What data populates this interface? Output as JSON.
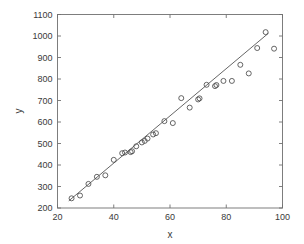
{
  "figure": {
    "background_color": "#ffffff",
    "axis_color": "#707070",
    "marker_color": "#4a4a4a",
    "line_color": "#555555"
  },
  "axes": {
    "x_title": "x",
    "y_title": "y",
    "x_ticks": [
      "20",
      "40",
      "60",
      "80",
      "100"
    ],
    "y_ticks": [
      "200",
      "300",
      "400",
      "500",
      "600",
      "700",
      "800",
      "900",
      "1000",
      "1100"
    ]
  },
  "chart_data": {
    "type": "scatter",
    "title": "",
    "xlabel": "x",
    "ylabel": "y",
    "xlim": [
      20,
      100
    ],
    "ylim": [
      200,
      1100
    ],
    "xticks": [
      20,
      40,
      60,
      80,
      100
    ],
    "yticks": [
      200,
      300,
      400,
      500,
      600,
      700,
      800,
      900,
      1000,
      1100
    ],
    "grid": false,
    "legend": null,
    "marker": "open-circle",
    "series": [
      {
        "name": "observations",
        "type": "scatter",
        "points": [
          [
            25,
            245
          ],
          [
            28,
            258
          ],
          [
            31,
            312
          ],
          [
            34,
            345
          ],
          [
            37,
            352
          ],
          [
            40,
            424
          ],
          [
            43,
            455
          ],
          [
            44,
            458
          ],
          [
            46,
            460
          ],
          [
            46.5,
            464
          ],
          [
            48,
            487
          ],
          [
            50,
            505
          ],
          [
            51,
            512
          ],
          [
            52,
            523
          ],
          [
            54,
            542
          ],
          [
            55,
            548
          ],
          [
            58,
            604
          ],
          [
            61,
            595
          ],
          [
            64,
            711
          ],
          [
            67,
            667
          ],
          [
            70,
            705
          ],
          [
            70.5,
            710
          ],
          [
            73,
            773
          ],
          [
            76,
            767
          ],
          [
            76.5,
            772
          ],
          [
            79,
            791
          ],
          [
            82,
            791
          ],
          [
            85,
            866
          ],
          [
            88,
            826
          ],
          [
            91,
            944
          ],
          [
            94,
            1018
          ],
          [
            97,
            941
          ]
        ]
      },
      {
        "name": "fitted-line",
        "type": "line",
        "endpoints": [
          [
            24,
            233
          ],
          [
            95,
            1013
          ]
        ]
      }
    ]
  }
}
